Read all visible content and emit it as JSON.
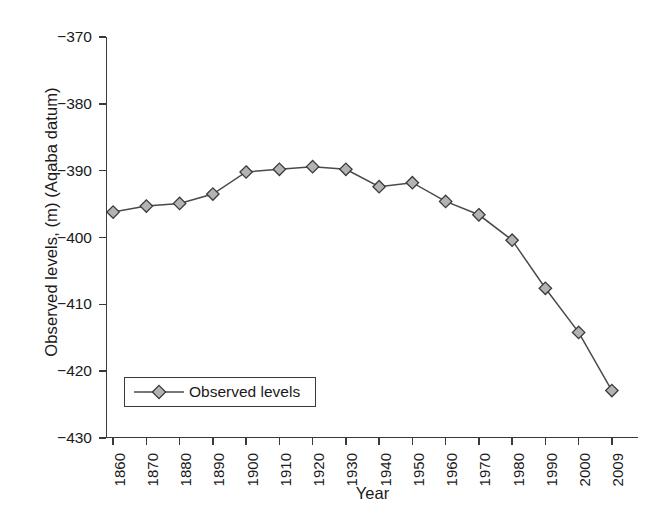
{
  "chart_data": {
    "type": "line",
    "title": "",
    "xlabel": "Year",
    "ylabel": "Observed levels, (m) (Aqaba datum)",
    "categories": [
      "1860",
      "1870",
      "1880",
      "1890",
      "1900",
      "1910",
      "1920",
      "1930",
      "1940",
      "1950",
      "1960",
      "1970",
      "1980",
      "1990",
      "2000",
      "2009"
    ],
    "series": [
      {
        "name": "Observed levels",
        "values": [
          -396.2,
          -395.3,
          -394.9,
          -393.5,
          -390.2,
          -389.8,
          -389.4,
          -389.8,
          -392.4,
          -391.8,
          -394.6,
          -396.6,
          -400.4,
          -407.6,
          -414.2,
          -422.9
        ]
      }
    ],
    "ylim": [
      -430,
      -370
    ],
    "yticks": [
      -370,
      -380,
      -390,
      -400,
      -410,
      -420,
      -430
    ],
    "ytick_labels": [
      "−370",
      "−380",
      "−390",
      "−400",
      "−410",
      "−420",
      "−430"
    ],
    "grid": false,
    "legend_position": "lower left",
    "marker": "diamond",
    "colors": {
      "line": "#4a4a4a",
      "marker_fill": "#b3b3b3",
      "marker_edge": "#3a3a3a",
      "axis": "#3a3a3a",
      "text": "#1a1a1a",
      "background": "#ffffff"
    }
  },
  "legend": {
    "entries": [
      {
        "label": "Observed levels"
      }
    ]
  }
}
